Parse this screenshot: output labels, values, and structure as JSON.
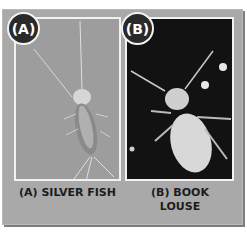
{
  "figure": {
    "panels": [
      {
        "badge": "(A)",
        "caption": "(A) SILVER FISH",
        "subject": "silverfish-photo"
      },
      {
        "badge": "(B)",
        "caption_line1": "(B) BOOK",
        "caption_line2": "LOUSE",
        "subject": "book-louse-photo"
      }
    ]
  }
}
